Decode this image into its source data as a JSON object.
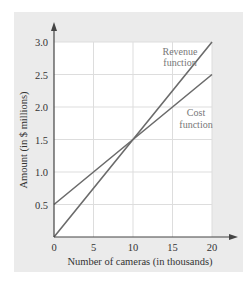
{
  "chart_data": {
    "type": "line",
    "title": "",
    "xlabel": "Number of cameras (in thousands)",
    "ylabel": "Amount (in $ millions)",
    "xlim": [
      0,
      20
    ],
    "ylim": [
      0,
      3.0
    ],
    "x_ticks": [
      "0",
      "5",
      "10",
      "15",
      "20"
    ],
    "y_ticks": [
      "0.5",
      "1.0",
      "1.5",
      "2.0",
      "2.5",
      "3.0"
    ],
    "grid": true,
    "series": [
      {
        "name": "Revenue function",
        "x": [
          0,
          10,
          20
        ],
        "values": [
          0,
          1.5,
          3.0
        ],
        "color": "#6b6b6b"
      },
      {
        "name": "Cost function",
        "x": [
          0,
          10,
          20
        ],
        "values": [
          0.5,
          1.5,
          2.5
        ],
        "color": "#6b6b6b"
      }
    ],
    "annotations": [
      {
        "text": [
          "Revenue",
          "function"
        ],
        "near": "revenue line upper right"
      },
      {
        "text": [
          "Cost",
          "function"
        ],
        "near": "cost line right"
      }
    ]
  },
  "labels": {
    "revenue_line1": "Revenue",
    "revenue_line2": "function",
    "cost_line1": "Cost",
    "cost_line2": "function"
  },
  "colors": {
    "panel": "#ebebeb",
    "plot_bg": "#ffffff",
    "grid": "#dddddd",
    "line": "#6b6b6b",
    "axis": "#444444"
  }
}
